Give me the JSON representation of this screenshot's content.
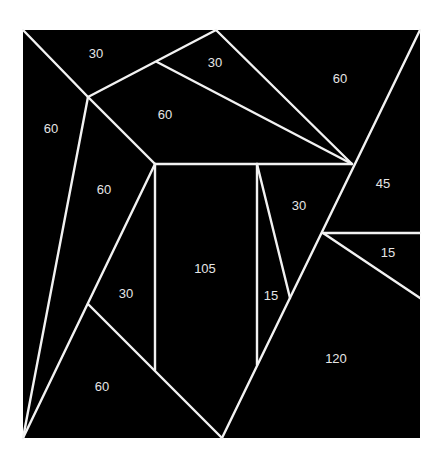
{
  "diagram": {
    "background": "#ffffff",
    "fill": "#000000",
    "line_color": "#f2f2f2",
    "label_color": "#e6e6e6",
    "square": {
      "x1": 23,
      "y1": 30,
      "x2": 420,
      "y2": 438
    },
    "lines": [
      [
        23,
        30,
        88,
        97
      ],
      [
        88,
        97,
        216,
        30
      ],
      [
        216,
        30,
        352,
        164
      ],
      [
        157,
        62,
        352,
        164
      ],
      [
        420,
        30,
        222,
        438
      ],
      [
        88,
        97,
        155,
        164
      ],
      [
        155,
        164,
        352,
        164
      ],
      [
        155,
        164,
        155,
        370
      ],
      [
        257,
        164,
        257,
        365
      ],
      [
        257,
        164,
        290,
        298
      ],
      [
        88,
        97,
        23,
        438
      ],
      [
        155,
        164,
        23,
        438
      ],
      [
        88,
        304,
        222,
        438
      ],
      [
        323,
        233,
        420,
        233
      ],
      [
        323,
        233,
        420,
        298
      ]
    ],
    "labels": [
      {
        "text": "30",
        "x": 96,
        "y": 55
      },
      {
        "text": "30",
        "x": 215,
        "y": 64
      },
      {
        "text": "60",
        "x": 340,
        "y": 80
      },
      {
        "text": "60",
        "x": 51,
        "y": 130
      },
      {
        "text": "60",
        "x": 165,
        "y": 116
      },
      {
        "text": "60",
        "x": 104,
        "y": 191
      },
      {
        "text": "30",
        "x": 299,
        "y": 207
      },
      {
        "text": "45",
        "x": 383,
        "y": 185
      },
      {
        "text": "15",
        "x": 388,
        "y": 254
      },
      {
        "text": "105",
        "x": 205,
        "y": 270
      },
      {
        "text": "30",
        "x": 126,
        "y": 295
      },
      {
        "text": "15",
        "x": 271,
        "y": 297
      },
      {
        "text": "120",
        "x": 336,
        "y": 360
      },
      {
        "text": "60",
        "x": 102,
        "y": 388
      }
    ]
  }
}
